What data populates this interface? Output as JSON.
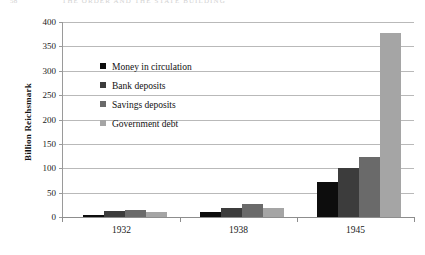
{
  "running_header": {
    "folio": "58",
    "title": "THE ORDER AND THE STATE BUILDING"
  },
  "chart_data": {
    "type": "bar",
    "title": "",
    "xlabel": "",
    "ylabel": "Billion Reichsmark",
    "categories": [
      "1932",
      "1938",
      "1945"
    ],
    "series": [
      {
        "name": "Money in circulation",
        "color": "#0d0d0d",
        "values": [
          5,
          10,
          72
        ]
      },
      {
        "name": "Bank deposits",
        "color": "#3c3c3c",
        "values": [
          13,
          18,
          100
        ]
      },
      {
        "name": "Savings deposits",
        "color": "#6a6a6a",
        "values": [
          15,
          26,
          124
        ]
      },
      {
        "name": "Government debt",
        "color": "#a5a5a5",
        "values": [
          10,
          18,
          378
        ]
      }
    ],
    "ylim": [
      0,
      400
    ],
    "yticks": [
      0,
      50,
      100,
      150,
      200,
      250,
      300,
      350,
      400
    ],
    "ytick_labels": [
      "0",
      "50",
      "100",
      "150",
      "200",
      "250",
      "300",
      "350",
      "400"
    ],
    "grid": true,
    "legend_position": "upper-left-inside"
  }
}
